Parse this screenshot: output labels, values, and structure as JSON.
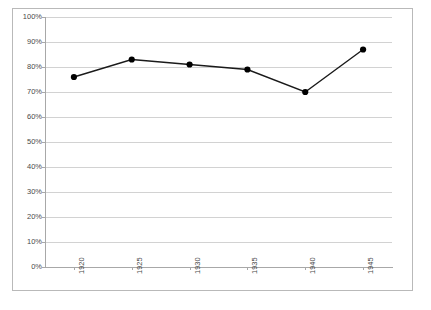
{
  "chart_data": {
    "type": "line",
    "title": "",
    "subtitle": "",
    "xlabel": "",
    "ylabel": "",
    "categories": [
      "1920",
      "1925",
      "1930",
      "1935",
      "1940",
      "1945"
    ],
    "x": [
      1920,
      1925,
      1930,
      1935,
      1940,
      1945
    ],
    "values": [
      76,
      83,
      81,
      79,
      70,
      87
    ],
    "series": [
      {
        "name": "",
        "values": [
          76,
          83,
          81,
          79,
          70,
          87
        ]
      }
    ],
    "y_tick_labels": [
      "100%",
      "90%",
      "80%",
      "70%",
      "60%",
      "50%",
      "40%",
      "30%",
      "20%",
      "10%",
      "0%"
    ],
    "y_tick_values": [
      100,
      90,
      80,
      70,
      60,
      50,
      40,
      30,
      20,
      10,
      0
    ],
    "ylim": [
      0,
      100
    ],
    "xlim": [
      1917.5,
      1947.5
    ],
    "grid": true,
    "grid_axis": "y",
    "legend": false,
    "legend_position": "none",
    "marker": "circle",
    "line_color": "#1a1a1a",
    "marker_color": "#000000",
    "grid_color": "#d2d2d2",
    "axis_color": "#a8a8a8",
    "background_color": "#ffffff",
    "x_tick_label_rotation": -90,
    "annotations": []
  }
}
